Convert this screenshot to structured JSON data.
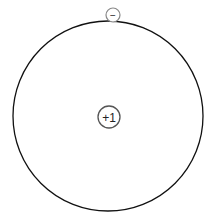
{
  "diagram": {
    "type": "bohr-model",
    "orbit": {
      "cx": 108,
      "cy": 116,
      "r": 95,
      "stroke": "#111111"
    },
    "nucleus": {
      "cx": 109,
      "cy": 117,
      "r": 11,
      "label": "+1",
      "stroke": "#555555"
    },
    "electron": {
      "cx": 113,
      "cy": 15,
      "r": 7,
      "label": "−",
      "stroke": "#888888"
    }
  }
}
